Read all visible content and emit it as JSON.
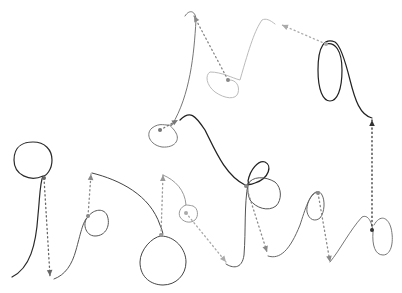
{
  "figure": {
    "width": 402,
    "height": 293,
    "background": "#ffffff"
  },
  "strokes": [
    {
      "id": "s1",
      "color": "#2a2a2a",
      "width": 1.2,
      "d": "M12,277 C30,268 36,245 38,215 C40,195 40,182 43,176 C30,182 14,175 14,160 C14,145 25,142 33,142 C45,142 52,150 52,160 C52,170 46,176 43,176"
    },
    {
      "id": "s2",
      "color": "#555555",
      "width": 1.0,
      "d": "M54,279 C65,275 72,265 76,250 C80,236 83,220 88,217 C82,222 85,236 95,236 C106,236 111,225 107,215 C103,207 92,210 88,217"
    },
    {
      "id": "s3",
      "color": "#444444",
      "width": 1.0,
      "d": "M92,173 C120,180 150,195 160,225 C163,232 164,236 161,236 C152,237 140,250 140,262 C140,278 152,285 163,285 C176,285 186,275 186,262 C186,249 175,236 161,236"
    },
    {
      "id": "s4",
      "color": "#999999",
      "width": 1.0,
      "d": "M163,175 C175,180 185,190 186,205 C180,207 178,213 180,217 C183,222 190,224 195,220 C199,216 198,208 193,206 C189,205 186,205 186,205"
    },
    {
      "id": "s5",
      "color": "#777777",
      "width": 1.0,
      "d": "M185,16 C190,8 196,12 196,20 C194,55 190,95 172,125 C165,126 160,122 152,128 C145,134 150,145 162,147 C175,148 180,140 176,133 C173,127 168,126 172,125"
    },
    {
      "id": "s6",
      "color": "#222222",
      "width": 1.3,
      "d": "M180,120 C190,110 195,115 205,130 C215,150 225,175 245,185 C248,186 250,184 248,181 C250,170 258,160 265,162 C272,165 270,178 255,183 C250,185 248,185 248,183"
    },
    {
      "id": "s7",
      "color": "#555555",
      "width": 1.0,
      "d": "M248,184 C244,205 246,230 244,255 C242,270 232,268 226,264 M248,184 C252,176 265,176 275,182 C282,188 282,200 276,206 C268,212 256,208 250,200 C247,193 248,188 248,184"
    },
    {
      "id": "s8",
      "color": "#bbbbbb",
      "width": 1.0,
      "d": "M275,24 C270,20 266,18 262,20 C255,30 250,45 240,80 C232,78 222,72 210,72 C205,75 206,85 215,92 C225,99 236,100 238,93 C240,86 236,80 230,80"
    },
    {
      "id": "s9",
      "color": "#666666",
      "width": 1.0,
      "d": "M268,256 C280,260 290,250 300,225 C305,210 310,192 317,192 C310,195 306,205 307,212 C309,220 315,222 320,218 C325,212 325,200 322,195 C320,191 318,192 317,192"
    },
    {
      "id": "s10",
      "color": "#777777",
      "width": 1.0,
      "d": "M330,262 C340,250 350,230 362,217 C368,214 372,222 373,232 C372,245 375,255 383,255 C392,255 394,240 391,228 C388,217 380,214 374,225"
    },
    {
      "id": "s11",
      "color": "#222222",
      "width": 1.2,
      "d": "M372,118 C360,115 355,100 350,80 C345,60 340,45 335,42 C325,38 318,45 318,70 C318,90 323,101 330,101 C337,101 342,90 342,70 C342,50 335,42 326,44"
    }
  ],
  "dotted_arrows": [
    {
      "id": "a1",
      "color": "#666666",
      "x1": 44,
      "y1": 178,
      "x2": 50,
      "y2": 276
    },
    {
      "id": "a2",
      "color": "#888888",
      "x1": 88,
      "y1": 216,
      "x2": 91,
      "y2": 174
    },
    {
      "id": "a3",
      "color": "#999999",
      "x1": 161,
      "y1": 235,
      "x2": 163,
      "y2": 175
    },
    {
      "id": "a4",
      "color": "#aaaaaa",
      "x1": 186,
      "y1": 213,
      "x2": 226,
      "y2": 262
    },
    {
      "id": "a5",
      "color": "#888888",
      "x1": 246,
      "y1": 186,
      "x2": 267,
      "y2": 252
    },
    {
      "id": "a6",
      "color": "#888888",
      "x1": 318,
      "y1": 193,
      "x2": 330,
      "y2": 262
    },
    {
      "id": "a7",
      "color": "#333333",
      "x1": 372,
      "y1": 230,
      "x2": 372,
      "y2": 120
    },
    {
      "id": "a8",
      "color": "#aaaaaa",
      "x1": 326,
      "y1": 44,
      "x2": 282,
      "y2": 25
    },
    {
      "id": "a9",
      "color": "#888888",
      "x1": 228,
      "y1": 80,
      "x2": 194,
      "y2": 16
    },
    {
      "id": "a10",
      "color": "#777777",
      "x1": 160,
      "y1": 130,
      "x2": 178,
      "y2": 120
    }
  ]
}
